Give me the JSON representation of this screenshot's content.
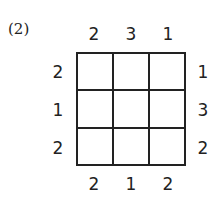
{
  "puzzle_label": "(2)",
  "grid_size": 3,
  "clues": {
    "top": [
      "2",
      "3",
      "1"
    ],
    "bottom": [
      "2",
      "1",
      "2"
    ],
    "left": [
      "2",
      "1",
      "2"
    ],
    "right": [
      "1",
      "3",
      "2"
    ]
  },
  "cells": [
    [
      "",
      "",
      ""
    ],
    [
      "",
      "",
      ""
    ],
    [
      "",
      "",
      ""
    ]
  ]
}
